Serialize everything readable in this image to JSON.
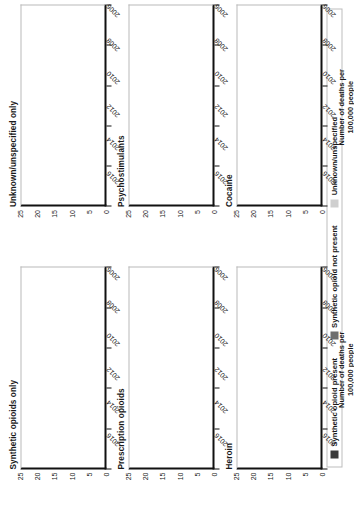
{
  "figure": {
    "axis_title_line1": "Number of deaths per",
    "axis_title_line2": "100,000 people"
  },
  "legend": {
    "items": [
      {
        "label": "Synthetic opioid present",
        "swatch": "present",
        "color": "#3a3a3a"
      },
      {
        "label": "Synthetic opioid not present",
        "swatch": "notpresent",
        "color": "#6e6e6e"
      },
      {
        "label": "Unknown/unspecified",
        "swatch": "unknown",
        "color": "#cfcfcf"
      }
    ]
  },
  "chart_data": {
    "type": "bar",
    "title": "",
    "xlabel": "Number of deaths per 100,000 people",
    "ylabel": "",
    "xlim": [
      0,
      25
    ],
    "xticks": [
      0,
      5,
      10,
      15,
      20,
      25
    ],
    "grid": false,
    "orientation": "horizontal",
    "stacked": true,
    "legend_position": "bottom",
    "categories": [
      "2006",
      "2007",
      "2008",
      "2009",
      "2010",
      "2011",
      "2012",
      "2013",
      "2014",
      "2015",
      "2016",
      "2017"
    ],
    "tick_labels": [
      "2006",
      "2008",
      "2010",
      "2012",
      "2014",
      "2016"
    ],
    "series_names": [
      "Synthetic opioid present",
      "Synthetic opioid not present",
      "Unknown/unspecified"
    ],
    "panels": [
      {
        "title": "Synthetic opioids only",
        "series": [
          {
            "name": "Synthetic opioid present",
            "values": [
              1.0,
              1.2,
              1.5,
              1.3,
              1.0,
              1.1,
              1.0,
              1.3,
              1.9,
              3.1,
              6.2,
              9.0
            ]
          },
          {
            "name": "Synthetic opioid not present",
            "values": [
              0,
              0,
              0,
              0,
              0,
              0,
              0,
              0,
              0,
              0,
              0,
              0
            ]
          },
          {
            "name": "Unknown/unspecified",
            "values": [
              0,
              0,
              0,
              0,
              0,
              0,
              0,
              0,
              0,
              0,
              0,
              0
            ]
          }
        ]
      },
      {
        "title": "Unknown/unspecified only",
        "series": [
          {
            "name": "Synthetic opioid present",
            "values": [
              0,
              0,
              0,
              0,
              0,
              0,
              0,
              0,
              0,
              0,
              0,
              0
            ]
          },
          {
            "name": "Synthetic opioid not present",
            "values": [
              0,
              0,
              0,
              0,
              0,
              0,
              0,
              0,
              0,
              0,
              0,
              0
            ]
          },
          {
            "name": "Unknown/unspecified",
            "values": [
              0,
              0,
              0,
              0,
              0,
              0,
              0,
              0,
              0,
              0.4,
              0.5,
              0.5
            ]
          }
        ]
      },
      {
        "title": "Prescription opioids",
        "series": [
          {
            "name": "Synthetic opioid present",
            "values": [
              0.6,
              0.7,
              0.8,
              0.9,
              1.0,
              1.2,
              2.9,
              1.4,
              1.8,
              2.6,
              3.6,
              4.3
            ]
          },
          {
            "name": "Synthetic opioid not present",
            "values": [
              4.2,
              7.0,
              8.6,
              10.6,
              12.5,
              12.5,
              10.3,
              12.6,
              12.8,
              13.4,
              13.8,
              13.6
            ]
          },
          {
            "name": "Unknown/unspecified",
            "values": [
              0,
              0,
              0,
              0,
              0,
              0,
              0,
              0,
              0,
              0,
              0,
              0
            ]
          }
        ]
      },
      {
        "title": "Psychostimulants",
        "series": [
          {
            "name": "Synthetic opioid present",
            "values": [
              0.1,
              0.1,
              0.1,
              0.1,
              0.2,
              0.2,
              0.3,
              0.4,
              0.6,
              1.0,
              2.0,
              3.4
            ]
          },
          {
            "name": "Synthetic opioid not present",
            "values": [
              0.5,
              0.5,
              0.5,
              0.6,
              0.6,
              0.9,
              1.2,
              1.5,
              2.1,
              3.0,
              4.6,
              6.1
            ]
          },
          {
            "name": "Unknown/unspecified",
            "values": [
              0,
              0,
              0,
              0,
              0,
              0,
              0,
              0,
              0,
              0,
              0,
              0
            ]
          }
        ]
      },
      {
        "title": "Heroin",
        "series": [
          {
            "name": "Synthetic opioid present",
            "values": [
              0.2,
              0.2,
              0.2,
              0.3,
              0.3,
              0.4,
              0.6,
              1.0,
              1.8,
              3.3,
              5.6,
              7.2
            ]
          },
          {
            "name": "Synthetic opioid not present",
            "values": [
              1.5,
              1.6,
              1.8,
              2.1,
              2.5,
              3.3,
              4.6,
              6.3,
              7.6,
              8.2,
              7.9,
              6.1
            ]
          },
          {
            "name": "Unknown/unspecified",
            "values": [
              0,
              0,
              0,
              0,
              0,
              0,
              0,
              0,
              0,
              0,
              0,
              0
            ]
          }
        ]
      },
      {
        "title": "Cocaine",
        "series": [
          {
            "name": "Synthetic opioid present",
            "values": [
              0.2,
              0.3,
              0.3,
              0.3,
              0.3,
              0.4,
              0.5,
              0.8,
              1.3,
              2.2,
              4.0,
              6.3
            ]
          },
          {
            "name": "Synthetic opioid not present",
            "values": [
              1.9,
              2.9,
              3.0,
              2.4,
              2.0,
              2.3,
              2.3,
              2.5,
              2.9,
              3.3,
              3.9,
              4.1
            ]
          },
          {
            "name": "Unknown/unspecified",
            "values": [
              0,
              0,
              0,
              0,
              0,
              0,
              0,
              0,
              0,
              0,
              0,
              0
            ]
          }
        ]
      }
    ]
  }
}
